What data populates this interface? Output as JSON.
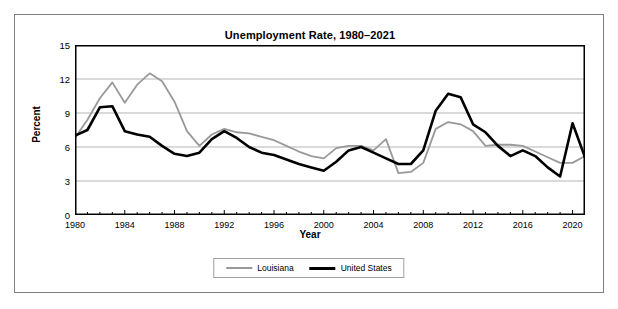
{
  "chart_data": {
    "type": "line",
    "title": "Unemployment Rate, 1980–2021",
    "xlabel": "Year",
    "ylabel": "Percent",
    "xlim": [
      1980,
      2021
    ],
    "ylim": [
      0,
      15
    ],
    "yticks": [
      0,
      3,
      6,
      9,
      12,
      15
    ],
    "xticks": [
      1980,
      1984,
      1988,
      1992,
      1996,
      2000,
      2004,
      2008,
      2012,
      2016,
      2020
    ],
    "grid": "horizontal",
    "legend_position": "bottom-center",
    "x": [
      1980,
      1981,
      1982,
      1983,
      1984,
      1985,
      1986,
      1987,
      1988,
      1989,
      1990,
      1991,
      1992,
      1993,
      1994,
      1995,
      1996,
      1997,
      1998,
      1999,
      2000,
      2001,
      2002,
      2003,
      2004,
      2005,
      2006,
      2007,
      2008,
      2009,
      2010,
      2011,
      2012,
      2013,
      2014,
      2015,
      2016,
      2017,
      2018,
      2019,
      2020,
      2021
    ],
    "series": [
      {
        "name": "Louisiana",
        "color": "#999999",
        "values": [
          6.8,
          8.4,
          10.3,
          11.7,
          9.9,
          11.5,
          12.5,
          11.8,
          10.0,
          7.4,
          6.1,
          7.1,
          7.6,
          7.3,
          7.2,
          6.9,
          6.6,
          6.1,
          5.6,
          5.2,
          5.0,
          5.9,
          6.1,
          6.1,
          5.7,
          6.7,
          3.7,
          3.8,
          4.6,
          7.6,
          8.2,
          8.0,
          7.4,
          6.1,
          6.2,
          6.2,
          6.1,
          5.6,
          5.1,
          4.6,
          4.6,
          5.2
        ]
      },
      {
        "name": "United States",
        "color": "#000000",
        "values": [
          7.0,
          7.5,
          9.5,
          9.6,
          7.4,
          7.1,
          6.9,
          6.1,
          5.4,
          5.2,
          5.5,
          6.7,
          7.4,
          6.8,
          6.0,
          5.5,
          5.3,
          4.9,
          4.5,
          4.2,
          3.9,
          4.7,
          5.7,
          6.0,
          5.5,
          5.0,
          4.5,
          4.5,
          5.7,
          9.2,
          10.7,
          10.4,
          8.0,
          7.3,
          6.1,
          5.2,
          5.7,
          5.2,
          4.2,
          3.4,
          8.1,
          5.1
        ]
      }
    ]
  },
  "legend": {
    "items": [
      {
        "label": "Louisiana"
      },
      {
        "label": "United States"
      }
    ]
  }
}
